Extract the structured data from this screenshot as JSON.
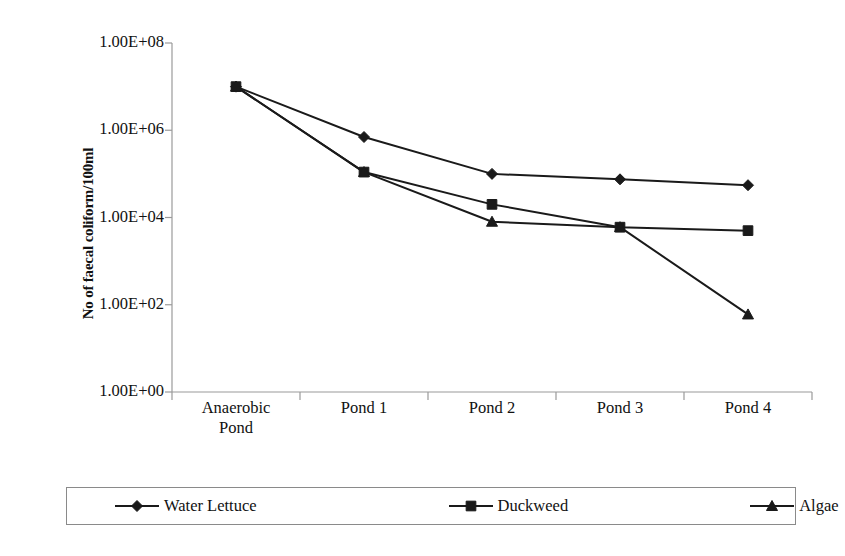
{
  "chart_data": {
    "type": "line",
    "title": "",
    "xlabel": "",
    "ylabel": "No of faecal coliform/100ml",
    "categories": [
      "Anaerobic Pond",
      "Pond 1",
      "Pond 2",
      "Pond 3",
      "Pond 4"
    ],
    "category_lines": [
      [
        "Anaerobic",
        "Pond"
      ],
      [
        "Pond 1",
        ""
      ],
      [
        "Pond 2",
        ""
      ],
      [
        "Pond 3",
        ""
      ],
      [
        "Pond 4",
        ""
      ]
    ],
    "y_scale": "log",
    "y_tick_labels": [
      "1.00E+08",
      "1.00E+06",
      "1.00E+04",
      "1.00E+02",
      "1.00E+00"
    ],
    "y_tick_values": [
      100000000,
      1000000,
      10000,
      100,
      1
    ],
    "ylim": [
      1,
      100000000
    ],
    "grid": false,
    "legend_position": "bottom",
    "series": [
      {
        "name": "Water Lettuce",
        "marker": "diamond",
        "color": "#1a1a1a",
        "values": [
          10000000,
          700000,
          100000,
          75000,
          55000
        ]
      },
      {
        "name": "Duckweed",
        "marker": "square",
        "color": "#1a1a1a",
        "values": [
          10000000,
          110000,
          20000,
          6000,
          5000
        ]
      },
      {
        "name": "Algae",
        "marker": "triangle",
        "color": "#1a1a1a",
        "values": [
          10000000,
          110000,
          8000,
          6000,
          60
        ]
      }
    ]
  },
  "legend": {
    "entries": [
      {
        "label": "Water Lettuce",
        "marker": "diamond"
      },
      {
        "label": "Duckweed",
        "marker": "square"
      },
      {
        "label": "Algae",
        "marker": "triangle"
      }
    ]
  },
  "axis": {
    "y_title": "No of faecal coliform/100ml"
  },
  "colors": {
    "line": "#1a1a1a",
    "axis": "#9a9a9a",
    "legend_border": "#8a8a8a",
    "background": "#ffffff"
  }
}
